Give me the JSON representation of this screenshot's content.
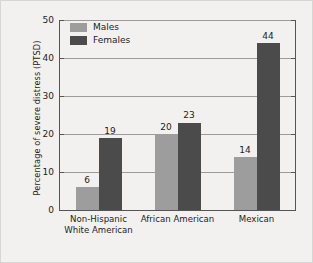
{
  "chart_data": {
    "type": "bar",
    "title": "",
    "subtitle": "",
    "xlabel": "",
    "ylabel": "Percentage of severe distress (PTSD)",
    "categories": [
      "Non-Hispanic\nWhite American",
      "African American",
      "Mexican"
    ],
    "category_lines": [
      [
        "Non-Hispanic",
        "White American"
      ],
      [
        "African American"
      ],
      [
        "Mexican"
      ]
    ],
    "series": [
      {
        "name": "Males",
        "values": [
          6,
          20,
          14
        ],
        "color": "#9d9d9d"
      },
      {
        "name": "Females",
        "values": [
          19,
          23,
          44
        ],
        "color": "#4b4b4b"
      }
    ],
    "ylim": [
      0,
      50
    ],
    "yticks": [
      0,
      10,
      20,
      30,
      40,
      50
    ],
    "ytick_labels": [
      "0",
      "10",
      "20",
      "30",
      "40",
      "50"
    ],
    "grid": true,
    "grid_axis": "y",
    "legend_position": "upper-left-inside",
    "data_labels": true,
    "bar_value_labels": [
      {
        "text": "6",
        "series": "Males",
        "category": "Non-Hispanic White American"
      },
      {
        "text": "19",
        "series": "Females",
        "category": "Non-Hispanic White American"
      },
      {
        "text": "20",
        "series": "Males",
        "category": "African American"
      },
      {
        "text": "23",
        "series": "Females",
        "category": "African American"
      },
      {
        "text": "14",
        "series": "Males",
        "category": "Mexican"
      },
      {
        "text": "44",
        "series": "Females",
        "category": "Mexican"
      }
    ]
  },
  "legend": {
    "items": [
      {
        "label": "Males",
        "color": "#9d9d9d"
      },
      {
        "label": "Females",
        "color": "#4b4b4b"
      }
    ]
  },
  "axis": {
    "y_title": "Percentage of severe distress (PTSD)",
    "y_labels": [
      "50",
      "40",
      "30",
      "20",
      "10",
      "0"
    ]
  },
  "colors": {
    "figure_background": "#f2f1ef",
    "figure_border": "#d8d6d2",
    "axis_line": "#555555",
    "gridline": "#9b9b9b",
    "text": "#1d1d1d",
    "males_bar": "#9d9d9d",
    "females_bar": "#4b4b4b"
  }
}
